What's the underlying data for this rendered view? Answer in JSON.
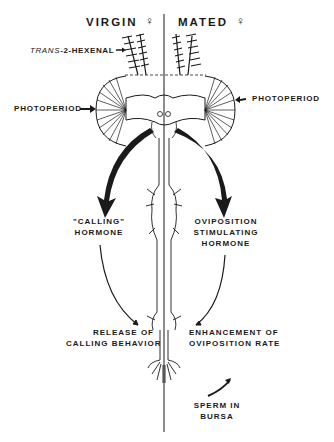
{
  "header": {
    "left_title": "VIRGIN",
    "left_symbol": "♀",
    "right_title": "MATED",
    "right_symbol": "♀"
  },
  "labels": {
    "antenna_stimulus_prefix": "TRANS",
    "antenna_stimulus_suffix": "-2-HEXENAL",
    "photoperiod_left": "PHOTOPERIOD",
    "photoperiod_right": "PHOTOPERIOD",
    "calling_hormone_line1": "\"CALLING\"",
    "calling_hormone_line2": "HORMONE",
    "ovip_hormone_line1": "OVIPOSITION",
    "ovip_hormone_line2": "STIMULATING",
    "ovip_hormone_line3": "HORMONE",
    "release_line1": "RELEASE OF",
    "release_line2": "CALLING BEHAVIOR",
    "enhance_line1": "ENHANCEMENT OF",
    "enhance_line2": "OVIPOSITION RATE",
    "sperm_line1": "SPERM IN",
    "sperm_line2": "BURSA"
  },
  "colors": {
    "ink": "#1a1a1a",
    "background": "#ffffff"
  }
}
